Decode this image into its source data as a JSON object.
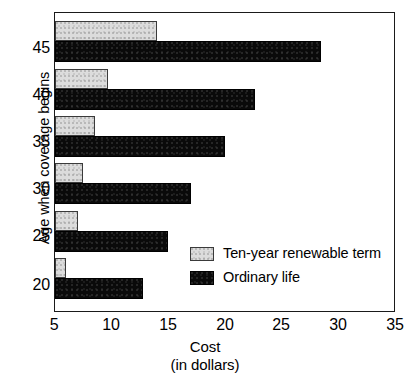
{
  "chart_data": {
    "type": "bar",
    "orientation": "horizontal",
    "title": "",
    "xlabel": "Cost",
    "xlabel_sub": "(in dollars)",
    "ylabel": "Age when coverage begins",
    "categories": [
      "20",
      "25",
      "30",
      "35",
      "40",
      "45"
    ],
    "xlim": [
      5,
      35
    ],
    "xticks": [
      "5",
      "10",
      "15",
      "20",
      "25",
      "30",
      "35"
    ],
    "yticks": [
      "20",
      "25",
      "30",
      "35",
      "40",
      "45"
    ],
    "grid": false,
    "legend_position": "inside-right-lower",
    "series": [
      {
        "name": "Ten-year renewable term",
        "color": "#dcdcdc",
        "values": [
          6,
          7,
          7.5,
          8.5,
          9.7,
          14
        ]
      },
      {
        "name": "Ordinary life",
        "color": "#0a0a0a",
        "values": [
          12.8,
          15,
          17,
          20,
          22.7,
          28.5
        ]
      }
    ]
  },
  "legend": {
    "items": [
      {
        "label": "Ten-year renewable term",
        "swatch": "light"
      },
      {
        "label": "Ordinary life",
        "swatch": "dark"
      }
    ]
  }
}
